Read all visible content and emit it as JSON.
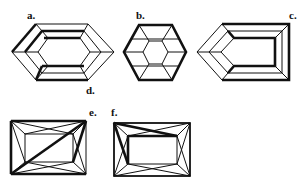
{
  "figure": {
    "colors": {
      "line": "#111111",
      "background": "#ffffff"
    }
  },
  "labels": {
    "a": "a.",
    "b": "b.",
    "c": "c.",
    "d": "d.",
    "e": "e.",
    "f": "f."
  },
  "diagrams": [
    {
      "id": "a",
      "shape": "elongated hexagon step cut"
    },
    {
      "id": "b",
      "shape": "hexagon cut"
    },
    {
      "id": "c",
      "shape": "shield / pentagon step cut"
    },
    {
      "id": "e",
      "shape": "rectangular cut with crossing facets"
    },
    {
      "id": "f",
      "shape": "rectangular cut with crossing facets"
    }
  ]
}
